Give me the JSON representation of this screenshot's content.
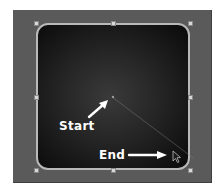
{
  "canvas": {
    "background_color": "#5a5a5a",
    "shape": {
      "type": "rounded-rectangle",
      "fill": "radial-gradient",
      "gradient_colors": [
        "#3a3a3a",
        "#0a0a0a"
      ],
      "border_color": "#b9b9b9"
    },
    "handles": [
      "top-left",
      "top-center",
      "top-right",
      "middle-left",
      "middle-right",
      "bottom-left",
      "bottom-center",
      "bottom-right"
    ]
  },
  "annotations": {
    "start_label": "Start",
    "end_label": "End",
    "start_arrow_icon": "arrow-up-right",
    "end_arrow_icon": "arrow-right"
  },
  "cursor": {
    "icon": "pointer-cursor-icon"
  }
}
